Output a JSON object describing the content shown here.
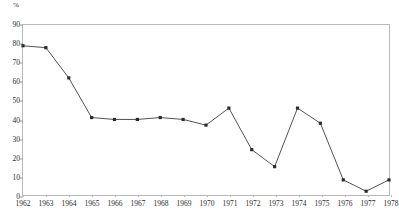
{
  "chart_data": {
    "type": "line",
    "title": "",
    "xlabel": "",
    "ylabel": "",
    "unit_label": "%",
    "categories": [
      "1962",
      "1963",
      "1964",
      "1965",
      "1966",
      "1967",
      "1968",
      "1969",
      "1970",
      "1971",
      "1972",
      "1973",
      "1974",
      "1975",
      "1976",
      "1977",
      "1978"
    ],
    "values": [
      79,
      78,
      62,
      41,
      40,
      40,
      41,
      40,
      37,
      46,
      24,
      15,
      46,
      38,
      8,
      2,
      8
    ],
    "series": [
      {
        "name": "",
        "values": [
          79,
          78,
          62,
          41,
          40,
          40,
          41,
          40,
          37,
          46,
          24,
          15,
          46,
          38,
          8,
          2,
          8
        ]
      }
    ],
    "ylim": [
      0,
      90
    ],
    "yticks": [
      0,
      10,
      20,
      30,
      40,
      50,
      60,
      70,
      80,
      90
    ],
    "ytick_labels": [
      "0",
      "10",
      "20",
      "30",
      "40",
      "50",
      "60",
      "70",
      "80",
      "90"
    ],
    "xtick_labels": [
      "1962",
      "1963",
      "1964",
      "1965",
      "1966",
      "1967",
      "1968",
      "1969",
      "1970",
      "1971",
      "1972",
      "1973",
      "1974",
      "1975",
      "1976",
      "1977",
      "1978"
    ],
    "grid": false,
    "legend": "none",
    "marker": "square",
    "line_color": "#3d3d3d",
    "marker_color": "#2a2a2a",
    "frame_color": "#b9b9b9"
  }
}
